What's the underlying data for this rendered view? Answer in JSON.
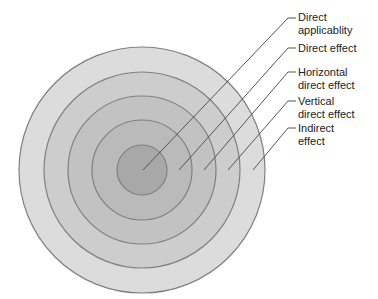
{
  "diagram": {
    "type": "concentric-circles",
    "center": {
      "x": 142,
      "y": 170
    },
    "rings": [
      {
        "name": "indirect-effect",
        "radius": 123,
        "fill": "#dcdcdc"
      },
      {
        "name": "vertical-direct-effect",
        "radius": 98,
        "fill": "#cdcdcd"
      },
      {
        "name": "horizontal-direct-effect",
        "radius": 74,
        "fill": "#c2c2c2"
      },
      {
        "name": "direct-effect",
        "radius": 50,
        "fill": "#bababa"
      },
      {
        "name": "direct-applicability",
        "radius": 25,
        "fill": "#a8a8a8"
      }
    ],
    "stroke_color": "#808080",
    "leader_color": "#555555",
    "labels": [
      {
        "line1": "Direct",
        "line2": "applicablity",
        "top": 11
      },
      {
        "line1": "Direct effect",
        "line2": "",
        "top": 42
      },
      {
        "line1": "Horizontal",
        "line2": "direct effect",
        "top": 69
      },
      {
        "line1": "Vertical",
        "line2": "direct effect",
        "top": 97
      },
      {
        "line1": "Indirect",
        "line2": "effect",
        "top": 124
      }
    ]
  }
}
